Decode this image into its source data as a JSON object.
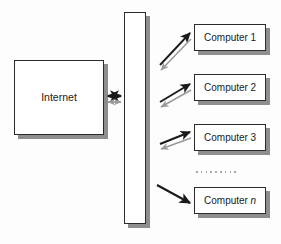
{
  "diagram": {
    "type": "network-firewall-topology",
    "background_color": "#fdfdfd",
    "shadow_color": "#8e8e8e",
    "border_color": "#2b2b2b",
    "nodes": {
      "internet": {
        "label": "Internet"
      },
      "firewall": {
        "label": ""
      },
      "computers": [
        {
          "label_prefix": "Computer",
          "label_suffix": "1",
          "suffix_italic": false
        },
        {
          "label_prefix": "Computer",
          "label_suffix": "2",
          "suffix_italic": false
        },
        {
          "label_prefix": "Computer",
          "label_suffix": "3",
          "suffix_italic": false
        },
        {
          "label_prefix": "Computer",
          "label_suffix": "n",
          "suffix_italic": true
        }
      ]
    },
    "ellipsis": {
      "dot_count": 9,
      "color": "#a8a8a8"
    },
    "connectors": {
      "internet_firewall": {
        "style": "double-headed",
        "outbound_color": "#1a1a1a",
        "inbound_color": "#9a9a9a"
      },
      "firewall_computers": {
        "style": "bidirectional-pair",
        "outbound_color": "#1a1a1a",
        "inbound_color": "#9a9a9a"
      },
      "firewall_computer_n": {
        "style": "single",
        "color": "#1a1a1a"
      }
    }
  }
}
